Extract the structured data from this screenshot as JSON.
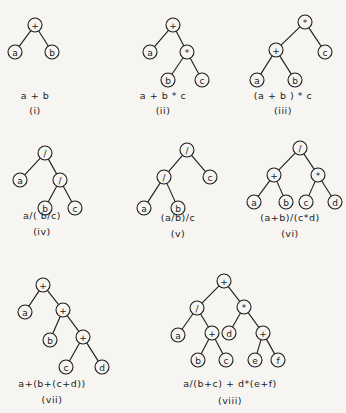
{
  "node_radius": 7,
  "trees": [
    {
      "id": "i",
      "expression": "a + b",
      "numeral": "(i)",
      "label_x": 35,
      "expr_y": 96,
      "num_y": 111,
      "nodes": [
        {
          "id": "n0",
          "sym": "+",
          "x": 35,
          "y": 25
        },
        {
          "id": "n1",
          "sym": "a",
          "x": 15,
          "y": 52
        },
        {
          "id": "n2",
          "sym": "b",
          "x": 52,
          "y": 52
        }
      ],
      "edges": [
        [
          "n0",
          "n1"
        ],
        [
          "n0",
          "n2"
        ]
      ]
    },
    {
      "id": "ii",
      "expression": "a + b * c",
      "numeral": "(ii)",
      "label_x": 163,
      "expr_y": 96,
      "num_y": 111,
      "nodes": [
        {
          "id": "n0",
          "sym": "+",
          "x": 173,
          "y": 25
        },
        {
          "id": "n1",
          "sym": "a",
          "x": 150,
          "y": 52
        },
        {
          "id": "n2",
          "sym": "*",
          "x": 187,
          "y": 52
        },
        {
          "id": "n3",
          "sym": "b",
          "x": 168,
          "y": 80
        },
        {
          "id": "n4",
          "sym": "c",
          "x": 202,
          "y": 80
        }
      ],
      "edges": [
        [
          "n0",
          "n1"
        ],
        [
          "n0",
          "n2"
        ],
        [
          "n2",
          "n3"
        ],
        [
          "n2",
          "n4"
        ]
      ]
    },
    {
      "id": "iii",
      "expression": "(a + b ) * c",
      "numeral": "(iii)",
      "label_x": 283,
      "expr_y": 96,
      "num_y": 111,
      "nodes": [
        {
          "id": "n0",
          "sym": "*",
          "x": 305,
          "y": 22
        },
        {
          "id": "n1",
          "sym": "+",
          "x": 276,
          "y": 50
        },
        {
          "id": "n2",
          "sym": "c",
          "x": 325,
          "y": 52
        },
        {
          "id": "n3",
          "sym": "a",
          "x": 257,
          "y": 80
        },
        {
          "id": "n4",
          "sym": "b",
          "x": 295,
          "y": 80
        }
      ],
      "edges": [
        [
          "n0",
          "n1"
        ],
        [
          "n0",
          "n2"
        ],
        [
          "n1",
          "n3"
        ],
        [
          "n1",
          "n4"
        ]
      ]
    },
    {
      "id": "iv",
      "expression": "a/( b/c)",
      "numeral": "(iv)",
      "label_x": 42,
      "expr_y": 216,
      "num_y": 232,
      "nodes": [
        {
          "id": "n0",
          "sym": "/",
          "x": 45,
          "y": 153
        },
        {
          "id": "n1",
          "sym": "a",
          "x": 20,
          "y": 180
        },
        {
          "id": "n2",
          "sym": "/",
          "x": 60,
          "y": 180
        },
        {
          "id": "n3",
          "sym": "b",
          "x": 45,
          "y": 208
        },
        {
          "id": "n4",
          "sym": "c",
          "x": 75,
          "y": 208
        }
      ],
      "edges": [
        [
          "n0",
          "n1"
        ],
        [
          "n0",
          "n2"
        ],
        [
          "n2",
          "n3"
        ],
        [
          "n2",
          "n4"
        ]
      ]
    },
    {
      "id": "v",
      "expression": "(a/b)/c",
      "numeral": "(v)",
      "label_x": 178,
      "expr_y": 218,
      "num_y": 234,
      "nodes": [
        {
          "id": "n0",
          "sym": "/",
          "x": 187,
          "y": 150
        },
        {
          "id": "n1",
          "sym": "/",
          "x": 164,
          "y": 177
        },
        {
          "id": "n2",
          "sym": "c",
          "x": 210,
          "y": 177
        },
        {
          "id": "n3",
          "sym": "a",
          "x": 144,
          "y": 208
        },
        {
          "id": "n4",
          "sym": "b",
          "x": 178,
          "y": 208
        }
      ],
      "edges": [
        [
          "n0",
          "n1"
        ],
        [
          "n0",
          "n2"
        ],
        [
          "n1",
          "n3"
        ],
        [
          "n1",
          "n4"
        ]
      ]
    },
    {
      "id": "vi",
      "expression": "(a+b)/(c*d)",
      "numeral": "(vi)",
      "label_x": 290,
      "expr_y": 218,
      "num_y": 234,
      "nodes": [
        {
          "id": "n0",
          "sym": "/",
          "x": 300,
          "y": 148
        },
        {
          "id": "n1",
          "sym": "+",
          "x": 274,
          "y": 175
        },
        {
          "id": "n2",
          "sym": "*",
          "x": 318,
          "y": 175
        },
        {
          "id": "n3",
          "sym": "a",
          "x": 254,
          "y": 202
        },
        {
          "id": "n4",
          "sym": "b",
          "x": 286,
          "y": 202
        },
        {
          "id": "n5",
          "sym": "c",
          "x": 306,
          "y": 202
        },
        {
          "id": "n6",
          "sym": "d",
          "x": 335,
          "y": 202
        }
      ],
      "edges": [
        [
          "n0",
          "n1"
        ],
        [
          "n0",
          "n2"
        ],
        [
          "n1",
          "n3"
        ],
        [
          "n1",
          "n4"
        ],
        [
          "n2",
          "n5"
        ],
        [
          "n2",
          "n6"
        ]
      ]
    },
    {
      "id": "vii",
      "expression": "a+(b+(c+d))",
      "numeral": "(vii)",
      "label_x": 52,
      "expr_y": 384,
      "num_y": 400,
      "nodes": [
        {
          "id": "n0",
          "sym": "+",
          "x": 43,
          "y": 285
        },
        {
          "id": "n1",
          "sym": "a",
          "x": 25,
          "y": 312
        },
        {
          "id": "n2",
          "sym": "+",
          "x": 63,
          "y": 310
        },
        {
          "id": "n3",
          "sym": "b",
          "x": 50,
          "y": 340
        },
        {
          "id": "n4",
          "sym": "+",
          "x": 83,
          "y": 337
        },
        {
          "id": "n5",
          "sym": "c",
          "x": 66,
          "y": 367
        },
        {
          "id": "n6",
          "sym": "d",
          "x": 102,
          "y": 367
        }
      ],
      "edges": [
        [
          "n0",
          "n1"
        ],
        [
          "n0",
          "n2"
        ],
        [
          "n2",
          "n3"
        ],
        [
          "n2",
          "n4"
        ],
        [
          "n4",
          "n5"
        ],
        [
          "n4",
          "n6"
        ]
      ]
    },
    {
      "id": "viii",
      "expression": "a/(b+c) + d*(e+f)",
      "numeral": "(viii)",
      "label_x": 230,
      "expr_y": 384,
      "num_y": 401,
      "nodes": [
        {
          "id": "n0",
          "sym": "+",
          "x": 224,
          "y": 281
        },
        {
          "id": "n1",
          "sym": "/",
          "x": 197,
          "y": 308
        },
        {
          "id": "n2",
          "sym": "*",
          "x": 244,
          "y": 307
        },
        {
          "id": "n3",
          "sym": "a",
          "x": 178,
          "y": 335
        },
        {
          "id": "n4",
          "sym": "+",
          "x": 212,
          "y": 333
        },
        {
          "id": "n5",
          "sym": "d",
          "x": 229,
          "y": 333
        },
        {
          "id": "n6",
          "sym": "+",
          "x": 263,
          "y": 333
        },
        {
          "id": "n7",
          "sym": "b",
          "x": 198,
          "y": 360
        },
        {
          "id": "n8",
          "sym": "c",
          "x": 226,
          "y": 360
        },
        {
          "id": "n9",
          "sym": "e",
          "x": 255,
          "y": 360
        },
        {
          "id": "n10",
          "sym": "f",
          "x": 278,
          "y": 360
        }
      ],
      "edges": [
        [
          "n0",
          "n1"
        ],
        [
          "n0",
          "n2"
        ],
        [
          "n1",
          "n3"
        ],
        [
          "n1",
          "n4"
        ],
        [
          "n4",
          "n7"
        ],
        [
          "n4",
          "n8"
        ],
        [
          "n2",
          "n5"
        ],
        [
          "n2",
          "n6"
        ],
        [
          "n6",
          "n9"
        ],
        [
          "n6",
          "n10"
        ]
      ]
    }
  ]
}
